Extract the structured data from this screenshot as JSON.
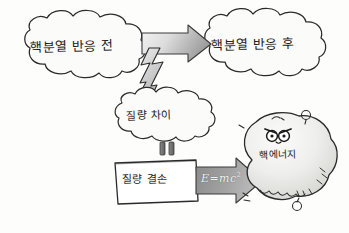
{
  "diagram": {
    "background_color": "#fdfdfc",
    "ink_color": "#1b1b1b",
    "nodes": {
      "cloud_before": {
        "label": "핵분열 반응 전",
        "shape": "cloud",
        "fill": "#fbfbfa"
      },
      "cloud_after": {
        "label": "핵분열 반응 후",
        "shape": "cloud",
        "fill": "#fbfbfa"
      },
      "cloud_mass_difference": {
        "label": "질량 차이",
        "shape": "cloud",
        "fill": "#fbfbfa"
      },
      "box_mass_defect": {
        "label": "질량 결손",
        "shape": "hand-drawn-rectangle",
        "fill": "#ffffff"
      },
      "blob_nuclear_energy": {
        "label": "핵에너지",
        "shape": "explosion-blob",
        "fill": "#e9e9e7",
        "face": "angry-eyes"
      }
    },
    "connectors": {
      "big_arrow": {
        "name": "block-arrow-right",
        "direction": "right",
        "fill_start": "#f0f0f0",
        "fill_end": "#9a9a9a"
      },
      "lightning_arrow": {
        "name": "lightning-arrow-down",
        "direction": "down",
        "fill": "#d8d8d8"
      },
      "equals_sign": {
        "name": "equals-sign",
        "label": "=",
        "fill": "#6f6f6f"
      },
      "emc2_arrow": {
        "name": "block-arrow-right-emc2",
        "direction": "right",
        "formula": "E=mc",
        "exponent": "2",
        "fill_start": "#8d8d8d",
        "fill_end": "#b9b9b9"
      }
    },
    "decorations": {
      "spark_small_circle": "small-circle-mark",
      "spark_ticks": "tick-marks",
      "blob_hatching": "hatch-lines"
    }
  }
}
